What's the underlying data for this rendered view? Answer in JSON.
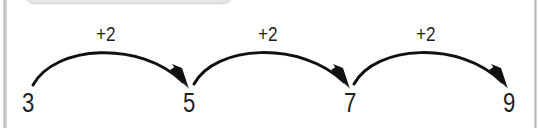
{
  "diagram": {
    "type": "number-line-jumps",
    "numbers": [
      "3",
      "5",
      "7",
      "9"
    ],
    "jumps": [
      {
        "label": "+2",
        "from": "3",
        "to": "5"
      },
      {
        "label": "+2",
        "from": "5",
        "to": "7"
      },
      {
        "label": "+2",
        "from": "7",
        "to": "9"
      }
    ],
    "colors": {
      "stroke": "#111111",
      "text": "#222222",
      "frame": "#c4c4c4",
      "background": "#ffffff"
    }
  }
}
